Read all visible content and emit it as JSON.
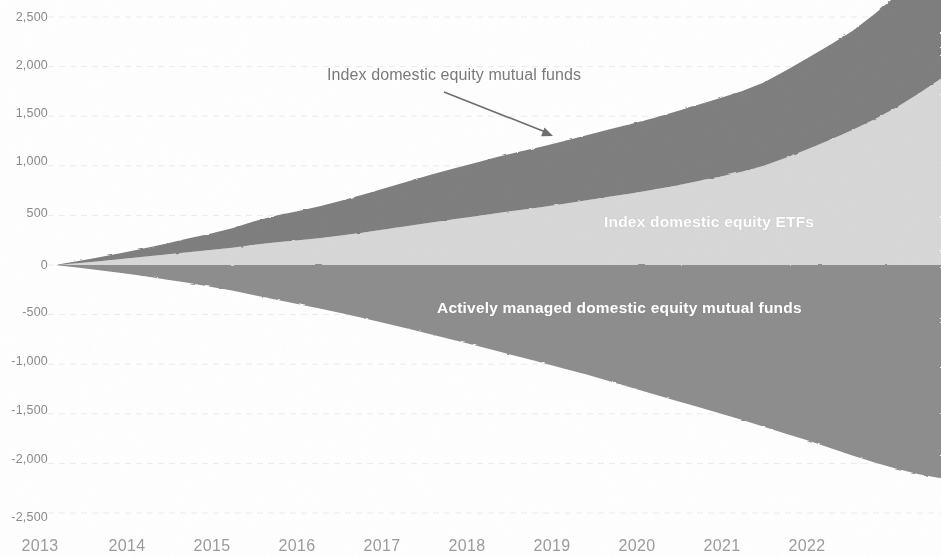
{
  "chart_data": {
    "type": "area",
    "title": "",
    "subtitle": "",
    "xlabel": "",
    "ylabel": "",
    "stacked": true,
    "grid": true,
    "grid_style": "faint horizontal",
    "legend_position": "inline annotations",
    "xlim": [
      2013,
      2023
    ],
    "ylim": [
      -2500,
      2500
    ],
    "y_ticks": [
      "2,500",
      "2,000",
      "1,500",
      "1,000",
      "500",
      "0",
      "-500",
      "-1,000",
      "-1,500",
      "-2,000",
      "-2,500"
    ],
    "y_tick_values": [
      2500,
      2000,
      1500,
      1000,
      500,
      0,
      -500,
      -1000,
      -1500,
      -2000,
      -2500
    ],
    "x_ticks": [
      "2013",
      "2014",
      "2015",
      "2016",
      "2017",
      "2018",
      "2019",
      "2020",
      "2021",
      "2022"
    ],
    "x_tick_values": [
      2013,
      2014,
      2015,
      2016,
      2017,
      2018,
      2019,
      2020,
      2021,
      2022
    ],
    "x": [
      2013.0,
      2013.25,
      2013.5,
      2013.75,
      2014.0,
      2014.25,
      2014.5,
      2014.75,
      2015.0,
      2015.25,
      2015.5,
      2015.75,
      2016.0,
      2016.25,
      2016.5,
      2016.75,
      2017.0,
      2017.25,
      2017.5,
      2017.75,
      2018.0,
      2018.25,
      2018.5,
      2018.75,
      2019.0,
      2019.25,
      2019.5,
      2019.75,
      2020.0,
      2020.25,
      2020.5,
      2020.75,
      2021.0,
      2021.25,
      2021.5,
      2021.75,
      2022.0,
      2022.25,
      2022.5,
      2022.75,
      2023.0
    ],
    "series": [
      {
        "name": "Index domestic equity ETFs",
        "color": "#d8d8d8",
        "stack_order": 1,
        "values": [
          0,
          18,
          38,
          60,
          82,
          105,
          128,
          150,
          175,
          205,
          230,
          250,
          272,
          300,
          330,
          362,
          395,
          428,
          460,
          492,
          525,
          555,
          585,
          618,
          652,
          688,
          722,
          758,
          800,
          845,
          890,
          940,
          1000,
          1080,
          1170,
          1262,
          1360,
          1470,
          1590,
          1730,
          1880
        ]
      },
      {
        "name": "Index domestic equity mutual funds",
        "color": "#7f7f7f",
        "stack_order": 2,
        "values": [
          0,
          20,
          40,
          62,
          85,
          110,
          138,
          165,
          195,
          235,
          268,
          295,
          322,
          352,
          385,
          418,
          452,
          485,
          512,
          538,
          565,
          588,
          610,
          632,
          655,
          678,
          700,
          722,
          745,
          768,
          790,
          812,
          840,
          880,
          920,
          958,
          1000,
          1060,
          1130,
          1210,
          1290
        ]
      },
      {
        "name": "Actively managed domestic equity mutual funds",
        "color": "#8e8e8e",
        "stack_order": 3,
        "values": [
          0,
          -25,
          -52,
          -80,
          -110,
          -145,
          -180,
          -218,
          -258,
          -305,
          -350,
          -395,
          -440,
          -490,
          -540,
          -592,
          -645,
          -700,
          -755,
          -812,
          -870,
          -928,
          -985,
          -1045,
          -1105,
          -1170,
          -1235,
          -1300,
          -1365,
          -1430,
          -1495,
          -1560,
          -1630,
          -1700,
          -1770,
          -1845,
          -1920,
          -1990,
          -2055,
          -2110,
          -2150
        ]
      }
    ],
    "annotations": [
      {
        "name": "index-domestic-equity-mutual-funds",
        "text": "Index domestic equity mutual funds",
        "arrow": true,
        "arrow_from": [
          444,
          92
        ],
        "arrow_to": [
          553,
          136
        ]
      }
    ],
    "inline_labels": [
      {
        "name": "index-domestic-equity-etfs",
        "text": "Index domestic equity ETFs"
      },
      {
        "name": "actively-managed-domestic-equity-mutual-funds",
        "text": "Actively managed domestic equity mutual funds"
      }
    ]
  },
  "axis": {
    "y_labels": [
      {
        "text": "2,500",
        "top": 10
      },
      {
        "text": "2,000",
        "top": 58
      },
      {
        "text": "1,500",
        "top": 106
      },
      {
        "text": "1,000",
        "top": 154
      },
      {
        "text": "500",
        "top": 206
      },
      {
        "text": "0",
        "top": 258
      },
      {
        "text": "-500",
        "top": 305
      },
      {
        "text": "-1,000",
        "top": 354
      },
      {
        "text": "-1,500",
        "top": 403
      },
      {
        "text": "-2,000",
        "top": 452
      },
      {
        "text": "-2,500",
        "top": 510
      }
    ],
    "x_labels": [
      {
        "text": "2013",
        "left": 40
      },
      {
        "text": "2014",
        "left": 127
      },
      {
        "text": "2015",
        "left": 212
      },
      {
        "text": "2016",
        "left": 297
      },
      {
        "text": "2017",
        "left": 382
      },
      {
        "text": "2018",
        "left": 467
      },
      {
        "text": "2019",
        "left": 552
      },
      {
        "text": "2020",
        "left": 637
      },
      {
        "text": "2021",
        "left": 722
      },
      {
        "text": "2022",
        "left": 807
      }
    ]
  },
  "colors": {
    "index_mutual_funds": "#7f7f7f",
    "index_etfs": "#d8d8d8",
    "active_mutual_funds": "#8e8e8e",
    "gridline": "#ececec",
    "tick_text": "#8f8f8f",
    "annotation_text": "#7a7a7a",
    "inline_label_text": "#ffffff",
    "background": "#ffffff"
  }
}
